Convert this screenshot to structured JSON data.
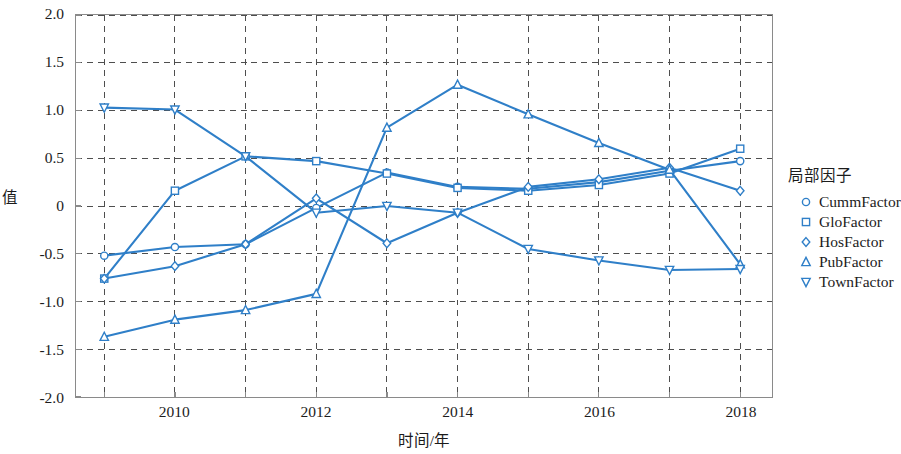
{
  "chart_data": {
    "type": "line",
    "title": "",
    "xlabel": "时间/年",
    "ylabel": "值",
    "xlim": [
      2008.6,
      2018.45
    ],
    "ylim": [
      -2.0,
      2.0
    ],
    "grid": true,
    "legend_position": "right",
    "legend_title": "局部因子",
    "accent_color": "#2f7fc8",
    "x": [
      2009,
      2010,
      2011,
      2012,
      2013,
      2014,
      2015,
      2016,
      2017,
      2018
    ],
    "xticks_major": [
      "2010",
      "2012",
      "2014",
      "2016",
      "2018"
    ],
    "xticks_major_values": [
      2010,
      2012,
      2014,
      2016,
      2018
    ],
    "xticks_all_values": [
      2009,
      2010,
      2011,
      2012,
      2013,
      2014,
      2015,
      2016,
      2017,
      2018
    ],
    "yticks": [
      "2.0",
      "1.5",
      "1.0",
      "0.5",
      "0",
      "-0.5",
      "-1.0",
      "-1.5",
      "-2.0"
    ],
    "ytick_values": [
      2.0,
      1.5,
      1.0,
      0.5,
      0,
      -0.5,
      -1.0,
      -1.5,
      -2.0
    ],
    "series": [
      {
        "name": "CummFactor",
        "marker": "circle",
        "color": "#2f7fc8",
        "values": [
          -0.52,
          -0.43,
          -0.4,
          -0.02,
          0.35,
          0.2,
          0.18,
          0.25,
          0.37,
          0.47
        ]
      },
      {
        "name": "GloFactor",
        "marker": "square",
        "color": "#2f7fc8",
        "values": [
          -0.76,
          0.16,
          0.52,
          0.47,
          0.34,
          0.19,
          0.16,
          0.22,
          0.34,
          0.6
        ]
      },
      {
        "name": "HosFactor",
        "marker": "diamond",
        "color": "#2f7fc8",
        "values": [
          -0.76,
          -0.63,
          -0.4,
          0.08,
          -0.39,
          -0.07,
          0.2,
          0.28,
          0.4,
          0.16
        ]
      },
      {
        "name": "PubFactor",
        "marker": "triangle-up",
        "color": "#2f7fc8",
        "values": [
          -1.37,
          -1.19,
          -1.09,
          -0.92,
          0.82,
          1.27,
          0.96,
          0.66,
          0.38,
          -0.61
        ]
      },
      {
        "name": "TownFactor",
        "marker": "triangle-down",
        "color": "#2f7fc8",
        "values": [
          1.03,
          1.01,
          0.52,
          -0.07,
          0.0,
          -0.07,
          -0.45,
          -0.57,
          -0.67,
          -0.66
        ]
      }
    ]
  },
  "axes": {
    "ylabel": "值",
    "xlabel": "时间/年"
  },
  "legend": {
    "title": "局部因子",
    "items": [
      {
        "label": "CummFactor",
        "marker": "circle"
      },
      {
        "label": "GloFactor",
        "marker": "square"
      },
      {
        "label": "HosFactor",
        "marker": "diamond"
      },
      {
        "label": "PubFactor",
        "marker": "triangle-up"
      },
      {
        "label": "TownFactor",
        "marker": "triangle-down"
      }
    ]
  }
}
